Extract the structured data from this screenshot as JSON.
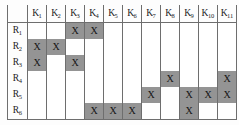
{
  "figure": {
    "type": "incidence-matrix-table",
    "mark_symbol": "X",
    "marked_fill_color": "#949494",
    "empty_fill_color": "#ffffff",
    "grid_line_color": "#6e6e6e",
    "text_color": "#1b1b1b"
  },
  "corner_label": "",
  "columns": [
    {
      "label": "K",
      "sub": "1"
    },
    {
      "label": "K",
      "sub": "2"
    },
    {
      "label": "K",
      "sub": "3"
    },
    {
      "label": "K",
      "sub": "4"
    },
    {
      "label": "K",
      "sub": "5"
    },
    {
      "label": "K",
      "sub": "6"
    },
    {
      "label": "K",
      "sub": "7"
    },
    {
      "label": "K",
      "sub": "8"
    },
    {
      "label": "K",
      "sub": "9"
    },
    {
      "label": "K",
      "sub": "10"
    },
    {
      "label": "K",
      "sub": "11"
    }
  ],
  "rows": [
    {
      "label": "R",
      "sub": "1",
      "cells": [
        "",
        "",
        "X",
        "X",
        "",
        "",
        "",
        "",
        "",
        "",
        ""
      ]
    },
    {
      "label": "R",
      "sub": "2",
      "cells": [
        "X",
        "X",
        "",
        "",
        "",
        "",
        "",
        "",
        "",
        "",
        ""
      ]
    },
    {
      "label": "R",
      "sub": "3",
      "cells": [
        "X",
        "",
        "X",
        "",
        "",
        "",
        "",
        "",
        "",
        "",
        ""
      ]
    },
    {
      "label": "R",
      "sub": "4",
      "cells": [
        "",
        "",
        "",
        "",
        "",
        "",
        "",
        "X",
        "",
        "",
        "X"
      ]
    },
    {
      "label": "R",
      "sub": "5",
      "cells": [
        "",
        "",
        "",
        "",
        "",
        "",
        "X",
        "",
        "X",
        "X",
        "X"
      ]
    },
    {
      "label": "R",
      "sub": "6",
      "cells": [
        "",
        "",
        "",
        "X",
        "X",
        "X",
        "",
        "",
        "X",
        "",
        ""
      ]
    }
  ]
}
